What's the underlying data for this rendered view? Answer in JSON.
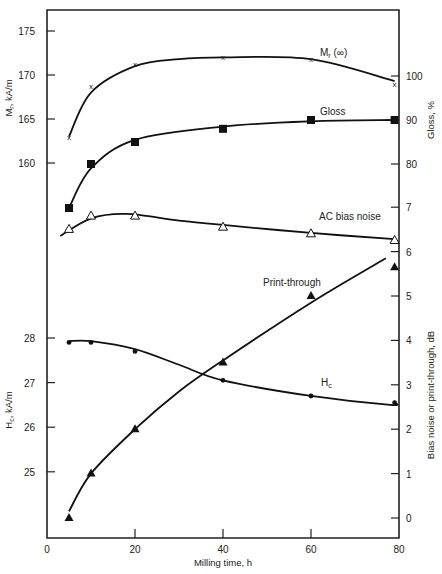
{
  "chart_data": {
    "type": "line",
    "title": "",
    "xlabel": "Milling time, h",
    "x_ticks": [
      0,
      20,
      40,
      60,
      80
    ],
    "xlim": [
      0,
      80
    ],
    "grid": false,
    "axes": {
      "left_top": {
        "label": "Mr, kA/m",
        "ticks": [
          160,
          165,
          170,
          175
        ]
      },
      "left_bottom": {
        "label": "Hc, kA/m",
        "ticks": [
          25,
          26,
          27,
          28
        ]
      },
      "right_top": {
        "label": "Gloss, %",
        "ticks": [
          80,
          90,
          100
        ]
      },
      "right_bottom": {
        "label": "Bias noise or print-through, dB",
        "ticks": [
          0,
          1,
          2,
          3,
          4,
          5,
          6,
          7
        ]
      }
    },
    "series": [
      {
        "name": "Mr(∞)",
        "axis": "left_top",
        "marker": "x",
        "unit": "kA/m",
        "x": [
          5,
          10,
          20,
          40,
          60,
          79
        ],
        "values": [
          163,
          168.7,
          171.2,
          172,
          171.8,
          169
        ]
      },
      {
        "name": "Gloss",
        "axis": "right_top",
        "marker": "filled-square",
        "unit": "%",
        "x": [
          5,
          10,
          20,
          40,
          60,
          79
        ],
        "values": [
          70,
          80,
          85,
          88,
          90,
          90
        ]
      },
      {
        "name": "AC bias noise",
        "axis": "right_bottom",
        "marker": "open-triangle",
        "unit": "dB",
        "x": [
          5,
          10,
          20,
          40,
          60,
          79
        ],
        "values": [
          6.5,
          6.8,
          6.8,
          6.55,
          6.4,
          6.25
        ]
      },
      {
        "name": "Print-through",
        "axis": "right_bottom",
        "marker": "filled-triangle",
        "unit": "dB",
        "x": [
          5,
          10,
          20,
          40,
          60,
          79
        ],
        "values": [
          0,
          1,
          2,
          3.5,
          5,
          5.65
        ]
      },
      {
        "name": "Hc",
        "axis": "left_bottom",
        "marker": "filled-circle",
        "unit": "kA/m",
        "x": [
          5,
          10,
          20,
          40,
          60,
          79
        ],
        "values": [
          27.9,
          27.9,
          27.7,
          27.05,
          26.7,
          26.55
        ]
      }
    ],
    "annotations": [
      {
        "text": "Mr(∞)",
        "near_series": "Mr(∞)"
      },
      {
        "text": "Gloss",
        "near_series": "Gloss"
      },
      {
        "text": "AC bias noise",
        "near_series": "AC bias noise"
      },
      {
        "text": "Print-through",
        "near_series": "Print-through"
      },
      {
        "text": "Hc",
        "near_series": "Hc"
      }
    ]
  },
  "labels": {
    "xlabel": "Milling time, h",
    "mr_axis": "Mr, kA/m",
    "hc_axis": "Hc, kA/m",
    "gloss_axis": "Gloss, %",
    "db_axis": "Bias noise or print-through, dB",
    "mr_series": "Mr(∞)",
    "gloss_series": "Gloss",
    "ac_series": "AC bias noise",
    "pt_series": "Print-through",
    "hc_series": "Hc"
  }
}
